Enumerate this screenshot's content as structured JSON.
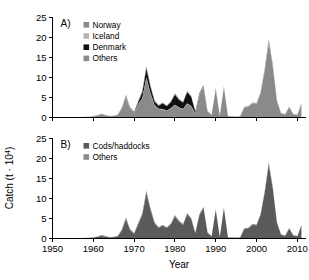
{
  "figure": {
    "ylabel": "Catch (t · 10⁴)",
    "xlabel": "Year",
    "panel_a_label": "A)",
    "panel_b_label": "B)"
  },
  "colors": {
    "norway": "#8a8a8a",
    "iceland": "#b4b4b4",
    "denmark": "#111111",
    "others": "#8a8a8a",
    "cods_haddocks": "#5a5a5a",
    "others_b": "#8a8a8a",
    "axis": "#000000",
    "background": "#ffffff"
  },
  "chart_data": [
    {
      "type": "area",
      "panel": "A",
      "title": "A)",
      "xlabel": "Year",
      "ylabel": "Catch (t · 10⁴)",
      "xlim": [
        1950,
        2012
      ],
      "ylim": [
        0,
        25
      ],
      "xticks": [
        1950,
        1960,
        1970,
        1980,
        1990,
        2000,
        2010
      ],
      "yticks": [
        0,
        5,
        10,
        15,
        20,
        25
      ],
      "grid": false,
      "stacked": true,
      "legend_position": "top-left",
      "legend": [
        "Norway",
        "Iceland",
        "Denmark",
        "Others"
      ],
      "x": [
        1950,
        1951,
        1952,
        1953,
        1954,
        1955,
        1956,
        1957,
        1958,
        1959,
        1960,
        1961,
        1962,
        1963,
        1964,
        1965,
        1966,
        1967,
        1968,
        1969,
        1970,
        1971,
        1972,
        1973,
        1974,
        1975,
        1976,
        1977,
        1978,
        1979,
        1980,
        1981,
        1982,
        1983,
        1984,
        1985,
        1986,
        1987,
        1988,
        1989,
        1990,
        1991,
        1992,
        1993,
        1994,
        1995,
        1996,
        1997,
        1998,
        1999,
        2000,
        2001,
        2002,
        2003,
        2004,
        2005,
        2006,
        2007,
        2008,
        2009,
        2010,
        2011
      ],
      "series": [
        {
          "name": "Norway",
          "values": [
            0.05,
            0.05,
            0.06,
            0.06,
            0.07,
            0.08,
            0.08,
            0.1,
            0.12,
            0.15,
            0.25,
            0.4,
            0.75,
            0.5,
            0.3,
            0.35,
            0.6,
            2.1,
            5.0,
            2.2,
            1.1,
            3.3,
            4.6,
            9.8,
            6.0,
            3.0,
            2.1,
            2.0,
            1.6,
            2.2,
            3.1,
            2.4,
            2.0,
            3.4,
            2.8,
            1.0,
            5.6,
            7.5,
            1.4,
            0.6,
            7.0,
            0.4,
            7.4,
            0.3,
            0.25,
            0.2,
            0.3,
            2.5,
            2.6,
            3.5,
            3.4,
            6.0,
            11.5,
            18.6,
            12.5,
            4.0,
            1.0,
            0.7,
            2.5,
            0.8,
            0.6,
            3.3
          ]
        },
        {
          "name": "Iceland",
          "values": [
            0.0,
            0.0,
            0.0,
            0.0,
            0.0,
            0.0,
            0.0,
            0.0,
            0.0,
            0.0,
            0.0,
            0.0,
            0.0,
            0.0,
            0.0,
            0.0,
            0.0,
            0.05,
            0.1,
            0.05,
            0.05,
            0.1,
            0.15,
            0.2,
            0.15,
            0.1,
            0.1,
            0.1,
            0.1,
            0.1,
            0.1,
            0.1,
            0.1,
            0.1,
            0.1,
            0.05,
            0.1,
            0.1,
            0.05,
            0.0,
            0.05,
            0.0,
            0.05,
            0.0,
            0.0,
            0.0,
            0.0,
            0.05,
            0.05,
            0.05,
            0.05,
            0.1,
            0.15,
            0.2,
            0.15,
            0.05,
            0.0,
            0.0,
            0.05,
            0.0,
            0.0,
            0.05
          ]
        },
        {
          "name": "Denmark",
          "values": [
            0.0,
            0.0,
            0.0,
            0.0,
            0.0,
            0.0,
            0.0,
            0.0,
            0.0,
            0.0,
            0.0,
            0.0,
            0.0,
            0.0,
            0.0,
            0.0,
            0.0,
            0.05,
            0.1,
            0.05,
            0.1,
            0.4,
            1.4,
            2.1,
            1.5,
            0.9,
            0.7,
            1.4,
            1.1,
            1.5,
            2.5,
            1.9,
            1.6,
            2.8,
            2.2,
            0.4,
            0.2,
            0.15,
            0.05,
            0.0,
            0.05,
            0.0,
            0.05,
            0.0,
            0.0,
            0.0,
            0.0,
            0.0,
            0.0,
            0.0,
            0.0,
            0.0,
            0.05,
            0.1,
            0.05,
            0.0,
            0.0,
            0.0,
            0.0,
            0.0,
            0.0,
            0.0
          ]
        },
        {
          "name": "Others",
          "values": [
            0.02,
            0.02,
            0.02,
            0.02,
            0.03,
            0.03,
            0.03,
            0.04,
            0.05,
            0.05,
            0.1,
            0.15,
            0.2,
            0.15,
            0.1,
            0.1,
            0.15,
            0.3,
            0.5,
            0.3,
            0.2,
            0.4,
            0.6,
            0.8,
            0.5,
            0.3,
            0.25,
            0.25,
            0.2,
            0.25,
            0.35,
            0.3,
            0.25,
            0.35,
            0.3,
            0.15,
            0.3,
            0.35,
            0.15,
            0.1,
            0.3,
            0.05,
            0.3,
            0.05,
            0.05,
            0.05,
            0.05,
            0.15,
            0.15,
            0.2,
            0.2,
            0.3,
            0.5,
            0.7,
            0.5,
            0.25,
            0.1,
            0.1,
            0.2,
            0.1,
            0.1,
            0.25
          ]
        }
      ]
    },
    {
      "type": "area",
      "panel": "B",
      "title": "B)",
      "xlabel": "Year",
      "ylabel": "Catch (t · 10⁴)",
      "xlim": [
        1950,
        2012
      ],
      "ylim": [
        0,
        25
      ],
      "xticks": [
        1950,
        1960,
        1970,
        1980,
        1990,
        2000,
        2010
      ],
      "yticks": [
        0,
        5,
        10,
        15,
        20,
        25
      ],
      "grid": false,
      "stacked": true,
      "legend_position": "top-left",
      "legend": [
        "Cods/haddocks",
        "Others"
      ],
      "x": [
        1950,
        1951,
        1952,
        1953,
        1954,
        1955,
        1956,
        1957,
        1958,
        1959,
        1960,
        1961,
        1962,
        1963,
        1964,
        1965,
        1966,
        1967,
        1968,
        1969,
        1970,
        1971,
        1972,
        1973,
        1974,
        1975,
        1976,
        1977,
        1978,
        1979,
        1980,
        1981,
        1982,
        1983,
        1984,
        1985,
        1986,
        1987,
        1988,
        1989,
        1990,
        1991,
        1992,
        1993,
        1994,
        1995,
        1996,
        1997,
        1998,
        1999,
        2000,
        2001,
        2002,
        2003,
        2004,
        2005,
        2006,
        2007,
        2008,
        2009,
        2010,
        2011
      ],
      "series": [
        {
          "name": "Cods/haddocks",
          "values": [
            0.04,
            0.04,
            0.05,
            0.05,
            0.06,
            0.07,
            0.07,
            0.09,
            0.11,
            0.14,
            0.22,
            0.35,
            0.7,
            0.45,
            0.28,
            0.32,
            0.55,
            2.0,
            4.8,
            2.1,
            1.15,
            3.5,
            5.8,
            11.2,
            7.2,
            3.8,
            2.6,
            3.2,
            2.6,
            3.5,
            5.5,
            4.2,
            3.4,
            6.0,
            4.8,
            1.3,
            5.8,
            7.6,
            1.4,
            0.55,
            7.1,
            0.35,
            7.5,
            0.28,
            0.22,
            0.18,
            0.28,
            2.4,
            2.55,
            3.4,
            3.3,
            5.9,
            11.4,
            18.4,
            12.3,
            3.9,
            0.95,
            0.65,
            2.45,
            0.75,
            0.55,
            3.2
          ]
        },
        {
          "name": "Others",
          "values": [
            0.02,
            0.02,
            0.02,
            0.02,
            0.03,
            0.03,
            0.03,
            0.04,
            0.05,
            0.05,
            0.1,
            0.15,
            0.2,
            0.15,
            0.1,
            0.1,
            0.15,
            0.3,
            0.5,
            0.3,
            0.2,
            0.4,
            0.6,
            0.8,
            0.5,
            0.3,
            0.25,
            0.25,
            0.2,
            0.25,
            0.35,
            0.3,
            0.25,
            0.35,
            0.3,
            0.15,
            0.3,
            0.35,
            0.15,
            0.1,
            0.3,
            0.05,
            0.3,
            0.05,
            0.05,
            0.05,
            0.05,
            0.15,
            0.15,
            0.2,
            0.2,
            0.3,
            0.5,
            0.7,
            0.5,
            0.25,
            0.1,
            0.1,
            0.2,
            0.1,
            0.1,
            0.25
          ]
        }
      ]
    }
  ],
  "axis_labels": {
    "y_ticks_a": [
      "0",
      "5",
      "10",
      "15",
      "20",
      "25"
    ],
    "y_ticks_b": [
      "0",
      "5",
      "10",
      "15",
      "20",
      "25"
    ],
    "x_ticks": [
      "1950",
      "1960",
      "1970",
      "1980",
      "1990",
      "2000",
      "2010"
    ]
  }
}
